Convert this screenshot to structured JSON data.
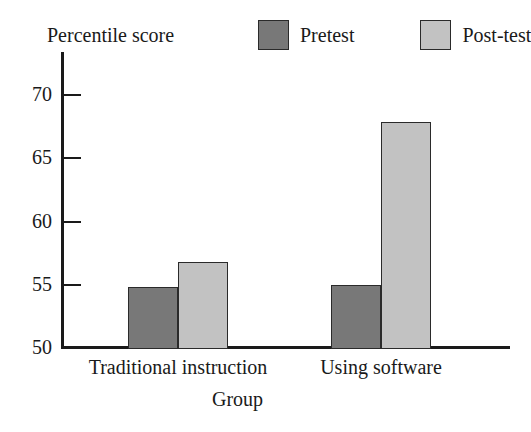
{
  "chart_data": {
    "type": "bar",
    "title": "",
    "subtitle": "",
    "xlabel": "Group",
    "ylabel": "Percentile score",
    "categories": [
      "Traditional instruction",
      "Using software"
    ],
    "series": [
      {
        "name": "Pretest",
        "color": "#787878",
        "values": [
          54.8,
          55.0
        ]
      },
      {
        "name": "Post-test",
        "color": "#c2c2c2",
        "values": [
          56.8,
          67.9
        ]
      }
    ],
    "ylim": [
      50,
      70
    ],
    "yticks": [
      50,
      55,
      60,
      65,
      70
    ],
    "ytick_labels": [
      "50",
      "55",
      "60",
      "65",
      "70"
    ],
    "grid": false,
    "legend_position": "top-right"
  },
  "legend": {
    "entries": [
      {
        "label": "Pretest",
        "swatch": "legend-swatch-pretest"
      },
      {
        "label": "Post-test",
        "swatch": "legend-swatch-posttest"
      }
    ]
  },
  "axis": {
    "y_title": "Percentile score",
    "x_title": "Group",
    "y_ticks": [
      "70",
      "65",
      "60",
      "55",
      "50"
    ],
    "x_categories": [
      "Traditional instruction",
      "Using software"
    ]
  },
  "colors": {
    "pretest": "#787878",
    "posttest": "#c2c2c2",
    "axis": "#1a1a1a",
    "bar_border": "#2a2a2a",
    "background": "#ffffff"
  }
}
